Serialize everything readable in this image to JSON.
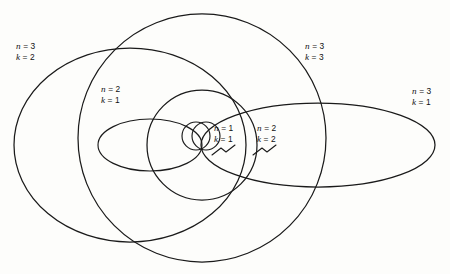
{
  "figure": {
    "type": "diagram",
    "background_color": "#fdfdfb",
    "stroke_color": "#1a1a1a",
    "width": 450,
    "height": 274,
    "common_focus": {
      "x": 202,
      "y": 145
    }
  },
  "orbits": [
    {
      "id": "n3k2",
      "n_label": "n = 3",
      "k_label": "k = 2",
      "n": 3,
      "k": 2,
      "shape": "ellipse",
      "cx": 130,
      "cy": 145,
      "rx": 116,
      "ry": 97,
      "rotation": 0
    },
    {
      "id": "n3k3",
      "n_label": "n = 3",
      "k_label": "k = 3",
      "n": 3,
      "k": 3,
      "shape": "circle",
      "cx": 202,
      "cy": 138,
      "rx": 124,
      "ry": 124,
      "rotation": 0
    },
    {
      "id": "n3k1",
      "n_label": "n = 3",
      "k_label": "k = 1",
      "n": 3,
      "k": 1,
      "shape": "ellipse",
      "cx": 318,
      "cy": 145,
      "rx": 117,
      "ry": 42,
      "rotation": 0
    },
    {
      "id": "n2k1",
      "n_label": "n = 2",
      "k_label": "k = 1",
      "n": 2,
      "k": 1,
      "shape": "ellipse",
      "cx": 150,
      "cy": 145,
      "rx": 52,
      "ry": 26,
      "rotation": 0
    },
    {
      "id": "n2k2",
      "n_label": "n = 2",
      "k_label": "k = 2",
      "n": 2,
      "k": 2,
      "shape": "circle",
      "cx": 202,
      "cy": 145,
      "rx": 55,
      "ry": 55,
      "rotation": 0
    },
    {
      "id": "n1k1",
      "n_label": "n = 1",
      "k_label": "k = 1",
      "n": 1,
      "k": 1,
      "shape": "circle",
      "cx": 196,
      "cy": 136,
      "rx": 14,
      "ry": 14,
      "rotation": 0
    },
    {
      "id": "n1k1b",
      "n_label": "n = 1",
      "k_label": "k = 1",
      "n": 1,
      "k": 1,
      "shape": "circle",
      "cx": 206,
      "cy": 136,
      "rx": 14,
      "ry": 14,
      "rotation": 0
    }
  ],
  "labels": [
    {
      "id": "lbl-n3k2",
      "n": "n = 3",
      "k": "k = 2",
      "x": 16,
      "y": 41
    },
    {
      "id": "lbl-n2k1",
      "n": "n = 2",
      "k": "k = 1",
      "x": 101,
      "y": 84
    },
    {
      "id": "lbl-n3k3",
      "n": "n = 3",
      "k": "k = 3",
      "x": 305,
      "y": 41
    },
    {
      "id": "lbl-n3k1",
      "n": "n = 3",
      "k": "k = 1",
      "x": 412,
      "y": 86
    },
    {
      "id": "lbl-n1k1",
      "n": "n = 1",
      "k": "k = 1",
      "x": 214,
      "y": 123
    },
    {
      "id": "lbl-n2k2",
      "n": "n = 2",
      "k": "k = 2",
      "x": 257,
      "y": 123
    }
  ],
  "leaders": [
    {
      "id": "leader-n1k1",
      "path": "M 212 155 L 221 148 L 226 152 L 235 145"
    },
    {
      "id": "leader-n2k2",
      "path": "M 253 155 L 262 148 L 267 152 L 276 145"
    }
  ]
}
